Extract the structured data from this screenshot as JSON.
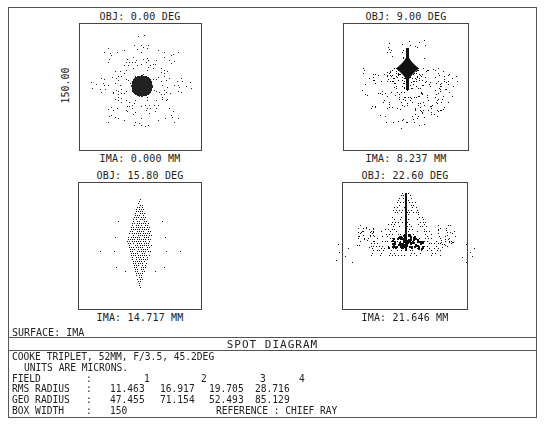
{
  "surface": "SURFACE: IMA",
  "title": "SPOT DIAGRAM",
  "box_label": "150.00",
  "info": {
    "line1": "COOKE TRIPLET, 52MM, F/3.5, 45.2DEG",
    "line2": "UNITS ARE MICRONS.",
    "field_label": "FIELD",
    "rms_label": "RMS RADIUS",
    "geo_label": "GEO RADIUS",
    "box_label": "BOX WIDTH",
    "colon": ":",
    "fields": [
      "1",
      "2",
      "3",
      "4"
    ],
    "rms": [
      "11.463",
      "16.917",
      "19.705",
      "28.716"
    ],
    "geo": [
      "47.455",
      "71.154",
      "52.493",
      "85.129"
    ],
    "box_width": "150",
    "reference": "REFERENCE  : CHIEF RAY"
  },
  "plots": [
    {
      "obj": "OBJ: 0.00 DEG",
      "ima": "IMA: 0.000 MM"
    },
    {
      "obj": "OBJ: 9.00 DEG",
      "ima": "IMA: 8.237 MM"
    },
    {
      "obj": "OBJ: 15.80 DEG",
      "ima": "IMA: 14.717 MM"
    },
    {
      "obj": "OBJ: 22.60 DEG",
      "ima": "IMA: 21.646 MM"
    }
  ],
  "chart_data": {
    "type": "scatter",
    "title": "SPOT DIAGRAM",
    "subtitle": "COOKE TRIPLET, 52MM, F/3.5, 45.2DEG",
    "units": "microns",
    "box_width_um": 150,
    "reference": "CHIEF RAY",
    "surface": "IMA",
    "grid": false,
    "series": [
      {
        "name": "Field 1",
        "obj_deg": 0.0,
        "ima_mm": 0.0,
        "rms_radius_um": 11.463,
        "geo_radius_um": 47.455,
        "pattern": "symmetric radial star centered",
        "xlim": [
          -75,
          75
        ],
        "ylim": [
          -75,
          75
        ]
      },
      {
        "name": "Field 2",
        "obj_deg": 9.0,
        "ima_mm": 8.237,
        "rms_radius_um": 16.917,
        "geo_radius_um": 71.154,
        "pattern": "dense diamond core upper-center with coma tail downward",
        "xlim": [
          -75,
          75
        ],
        "ylim": [
          -75,
          75
        ]
      },
      {
        "name": "Field 3",
        "obj_deg": 15.8,
        "ima_mm": 14.717,
        "rms_radius_um": 19.705,
        "geo_radius_um": 52.493,
        "pattern": "vertically elongated spindle",
        "xlim": [
          -75,
          75
        ],
        "ylim": [
          -75,
          75
        ]
      },
      {
        "name": "Field 4",
        "obj_deg": 22.6,
        "ima_mm": 21.646,
        "rms_radius_um": 28.716,
        "geo_radius_um": 85.129,
        "pattern": "fan/arrow pointing up, wings beyond box horizontally",
        "xlim": [
          -75,
          75
        ],
        "ylim": [
          -75,
          75
        ]
      }
    ]
  }
}
